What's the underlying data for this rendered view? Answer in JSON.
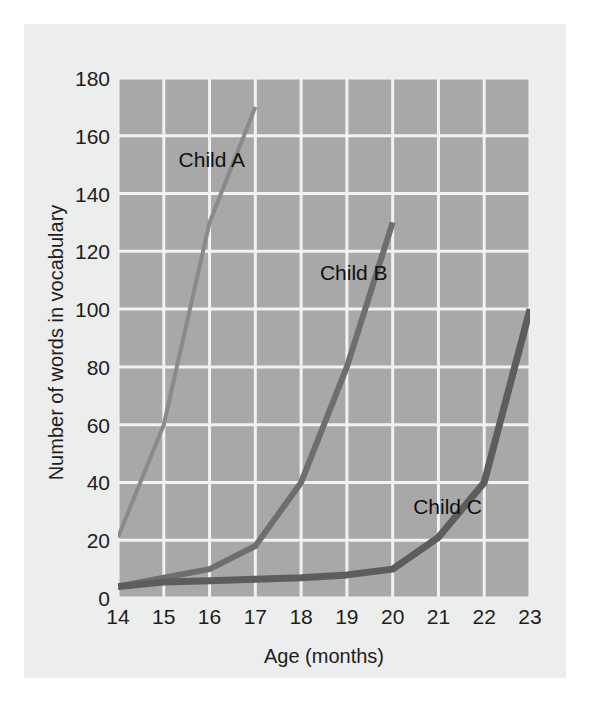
{
  "chart_data": {
    "type": "line",
    "title": "",
    "xlabel": "Age (months)",
    "ylabel": "Number of words in vocabulary",
    "xlim": [
      14,
      23
    ],
    "ylim": [
      0,
      180
    ],
    "xticks": [
      14,
      15,
      16,
      17,
      18,
      19,
      20,
      21,
      22,
      23
    ],
    "yticks": [
      0,
      20,
      40,
      60,
      80,
      100,
      120,
      140,
      160,
      180
    ],
    "grid": true,
    "legend_position": "inline-annotations",
    "plot_background": "#a8a8a8",
    "gridline_color": "#f2f2f2",
    "series": [
      {
        "name": "Child A",
        "color": "#8a8a8a",
        "line_width": 4,
        "x": [
          14,
          15,
          16,
          17
        ],
        "values": [
          21,
          60,
          130,
          170
        ],
        "label_x": 16.05,
        "label_y": 152
      },
      {
        "name": "Child B",
        "color": "#6e6e6e",
        "line_width": 6,
        "x": [
          14,
          15,
          16,
          17,
          18,
          19,
          20
        ],
        "values": [
          4,
          7,
          10,
          18,
          40,
          80,
          130
        ],
        "label_x": 19.15,
        "label_y": 113
      },
      {
        "name": "Child C",
        "color": "#5d5d5d",
        "line_width": 7,
        "x": [
          14,
          15,
          16,
          17,
          18,
          19,
          20,
          21,
          22,
          23
        ],
        "values": [
          4,
          5.5,
          6,
          6.5,
          7,
          8,
          10,
          21,
          40,
          100
        ],
        "label_x": 21.2,
        "label_y": 32
      }
    ]
  }
}
